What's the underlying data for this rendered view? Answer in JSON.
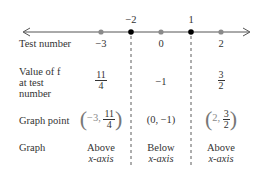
{
  "number_line": {
    "critical_points": [
      {
        "label": "−2",
        "value": -2
      },
      {
        "label": "1",
        "value": 1
      }
    ],
    "test_points": [
      {
        "label": "−3",
        "value": -3
      },
      {
        "label": "0",
        "value": 0
      },
      {
        "label": "2",
        "value": 2
      }
    ]
  },
  "rows": {
    "test_number": {
      "label": "Test number"
    },
    "value_of_f": {
      "label_line1": "Value of f",
      "label_line2": "at test",
      "label_line3": "number"
    },
    "graph_point": {
      "label": "Graph point"
    },
    "graph": {
      "label": "Graph"
    }
  },
  "intervals": [
    {
      "test_number": "−3",
      "value": {
        "num": "11",
        "den": "4"
      },
      "point": {
        "x": "−3,",
        "y_num": "11",
        "y_den": "4"
      },
      "graph": {
        "line1": "Above",
        "line2": "x-axis"
      }
    },
    {
      "test_number": "0",
      "value": {
        "text": "−1"
      },
      "point": {
        "text": "(0, −1)"
      },
      "graph": {
        "line1": "Below",
        "line2": "x-axis"
      }
    },
    {
      "test_number": "2",
      "value": {
        "num": "3",
        "den": "2"
      },
      "point": {
        "x": "2,",
        "y_num": "3",
        "y_den": "2"
      },
      "graph": {
        "line1": "Above",
        "line2": "x-axis"
      }
    }
  ],
  "colors": {
    "critical_point": "#000000",
    "test_point": "#808080",
    "line": "#444444"
  }
}
